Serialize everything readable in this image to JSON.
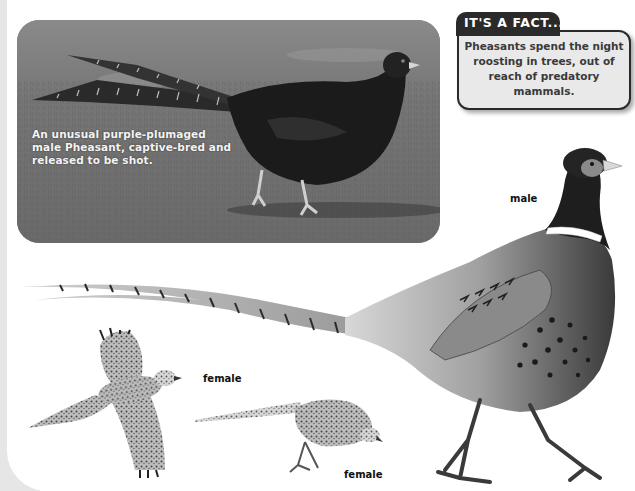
{
  "photo": {
    "caption": "An unusual purple-plumaged male Pheasant, captive-bred and released to be shot.",
    "subject": "purple-plumaged male pheasant on grass"
  },
  "fact_box": {
    "title": "IT'S A FACT...",
    "text": "Pheasants spend the night roosting in trees, out of reach of predatory mammals."
  },
  "illustrations": {
    "male": {
      "label": "male"
    },
    "female_flying": {
      "label": "female"
    },
    "female_feeding": {
      "label": "female"
    }
  },
  "colors": {
    "page_bg": "#ffffff",
    "page_edge": "#e6e6e6",
    "tab_dark": "#2a2a2a",
    "fact_bg": "#e9e9e9",
    "caption_text": "#f4f4f4",
    "label_text": "#111111"
  }
}
